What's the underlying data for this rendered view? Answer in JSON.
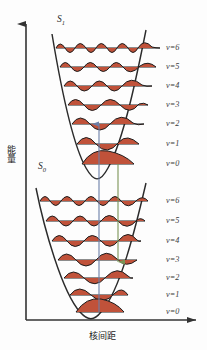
{
  "figure": {
    "title": "",
    "type": "energy-level-diagram"
  },
  "axes": {
    "y_label": "能量",
    "x_label": "核间距",
    "y_arrow": "up-arrow",
    "x_arrow": "right-arrow",
    "axis_color": "#333333"
  },
  "states": [
    {
      "id": "S1",
      "label_text": "S",
      "label_sub": "1",
      "x": 57,
      "y": 20
    },
    {
      "id": "S0",
      "label_text": "S",
      "label_sub": "0",
      "x": 38,
      "y": 167
    }
  ],
  "upper_state": {
    "name": "S1",
    "levels": [
      {
        "v": "v=6",
        "label_x": 166,
        "label_y": 43,
        "nodes": 6,
        "y": 48,
        "x1": 56,
        "x2": 160
      },
      {
        "v": "v=5",
        "label_x": 166,
        "label_y": 62,
        "nodes": 5,
        "y": 67,
        "x1": 60,
        "x2": 156
      },
      {
        "v": "v=4",
        "label_x": 166,
        "label_y": 81,
        "nodes": 4,
        "y": 86,
        "x1": 64,
        "x2": 152
      },
      {
        "v": "v=3",
        "label_x": 166,
        "label_y": 100,
        "nodes": 3,
        "y": 105,
        "x1": 68,
        "x2": 148
      },
      {
        "v": "v=2",
        "label_x": 166,
        "label_y": 119,
        "nodes": 2,
        "y": 124,
        "x1": 72,
        "x2": 144
      },
      {
        "v": "v=1",
        "label_x": 166,
        "label_y": 139,
        "nodes": 1,
        "y": 144,
        "x1": 77,
        "x2": 139
      },
      {
        "v": "v=0",
        "label_x": 166,
        "label_y": 159,
        "nodes": 0,
        "y": 164,
        "x1": 82,
        "x2": 134
      }
    ]
  },
  "lower_state": {
    "name": "S0",
    "levels": [
      {
        "v": "v=6",
        "label_x": 166,
        "label_y": 196,
        "nodes": 6,
        "y": 201,
        "x1": 40,
        "x2": 148
      },
      {
        "v": "v=5",
        "label_x": 166,
        "label_y": 216,
        "nodes": 5,
        "y": 221,
        "x1": 46,
        "x2": 145
      },
      {
        "v": "v=4",
        "label_x": 166,
        "label_y": 236,
        "nodes": 4,
        "y": 241,
        "x1": 52,
        "x2": 141
      },
      {
        "v": "v=3",
        "label_x": 166,
        "label_y": 255,
        "nodes": 3,
        "y": 260,
        "x1": 58,
        "x2": 137
      },
      {
        "v": "v=2",
        "label_x": 166,
        "label_y": 273,
        "nodes": 2,
        "y": 278,
        "x1": 64,
        "x2": 133
      },
      {
        "v": "v=1",
        "label_x": 166,
        "label_y": 290,
        "nodes": 1,
        "y": 295,
        "x1": 70,
        "x2": 128
      },
      {
        "v": "v=0",
        "label_x": 166,
        "label_y": 307,
        "nodes": 0,
        "y": 312,
        "x1": 76,
        "x2": 124
      }
    ]
  },
  "transitions": [
    {
      "name": "absorption",
      "color": "#6b7fa8",
      "x": 99,
      "y_top": 128,
      "y_bottom": 312,
      "direction": "up"
    },
    {
      "name": "emission",
      "color": "#7a9455",
      "x": 118,
      "y_top": 166,
      "y_bottom": 262,
      "direction": "down"
    }
  ],
  "colors": {
    "wavefunction_fill": "#c0523a",
    "wavefunction_stroke": "#1d1d1d",
    "potential_curve": "#2b2b2b",
    "level_line": "#1d1d1d",
    "background": "#fdfdfd"
  }
}
